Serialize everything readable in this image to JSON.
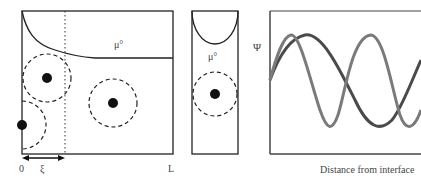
{
  "panels": {
    "left": {
      "mu_label": "μ°",
      "axis_labels": {
        "origin": "0",
        "xi": "ξ",
        "length": "L"
      }
    },
    "middle": {
      "mu_label": "μ°"
    },
    "right": {
      "y_label": "Ψ",
      "x_label": "Distance from interface"
    }
  },
  "colors": {
    "line": "#222222",
    "wave_dark": "#4a4a4a",
    "wave_light": "#7a7a7a"
  }
}
